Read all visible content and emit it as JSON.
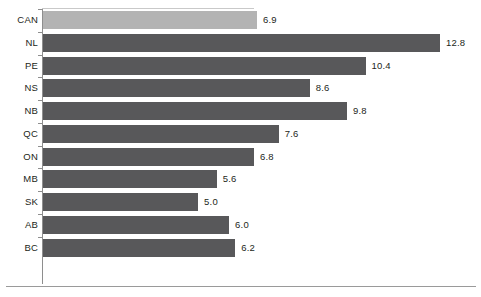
{
  "chart_data": {
    "type": "bar",
    "orientation": "horizontal",
    "title": "",
    "subtitle": "",
    "xlabel": "",
    "ylabel": "",
    "categories": [
      "CAN",
      "NL",
      "PE",
      "NS",
      "NB",
      "QC",
      "ON",
      "MB",
      "SK",
      "AB",
      "BC"
    ],
    "values": [
      6.9,
      12.8,
      10.4,
      8.6,
      9.8,
      7.6,
      6.8,
      5.6,
      5.0,
      6.0,
      6.2
    ],
    "value_labels": [
      "6.9",
      "12.8",
      "10.4",
      "8.6",
      "9.8",
      "7.6",
      "6.8",
      "5.6",
      "5.0",
      "6.0",
      "6.2"
    ],
    "xlim": [
      0,
      12.8
    ],
    "ylim": [],
    "grid": false,
    "legend": [],
    "legend_position": "none",
    "annotations": [],
    "series": [
      {
        "name": "",
        "values": [
          6.9,
          12.8,
          10.4,
          8.6,
          9.8,
          7.6,
          6.8,
          5.6,
          5.0,
          6.0,
          6.2
        ]
      }
    ],
    "highlight_category": "CAN"
  },
  "colors": {
    "bar_default": "#58585a",
    "bar_highlight": "#b3b3b3",
    "axis": "#8e8e8e",
    "text": "#231f20",
    "background": "#ffffff",
    "rule": "#9a9a9a"
  }
}
